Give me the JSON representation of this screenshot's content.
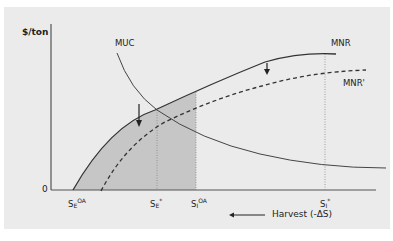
{
  "figure": {
    "y_axis_label": "$/ton",
    "origin_label": "0",
    "x_axis_caption": "Harvest (-ΔS)",
    "x_axis_arrow": "left-arrow",
    "curves": {
      "mnr": {
        "label": "MNR",
        "style": "solid"
      },
      "mnr_prime": {
        "label": "MNR'",
        "style": "dashed"
      },
      "muc": {
        "label": "MUC",
        "style": "solid"
      }
    },
    "x_markers": [
      {
        "base": "S",
        "sub": "E",
        "sup": "OA"
      },
      {
        "base": "S",
        "sub": "E",
        "sup": "*"
      },
      {
        "base": "S",
        "sub": "I",
        "sup": "OA"
      },
      {
        "base": "S",
        "sub": "I",
        "sup": "*"
      }
    ],
    "shaded_region": "area under MNR between S_E^OA and S_I^OA",
    "shift_arrows": 2,
    "colors": {
      "background": "#ebebeb",
      "shade": "#c4c4c4",
      "line": "#333333"
    }
  }
}
